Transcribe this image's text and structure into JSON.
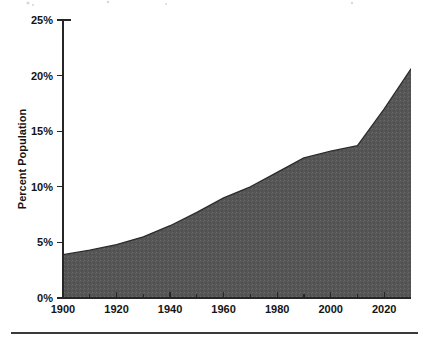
{
  "figure": {
    "background_color": "#ffffff",
    "footer_rule": {
      "name": "footer-rule",
      "color": "#3a3a3a"
    }
  },
  "chart_data": {
    "type": "area",
    "title": "",
    "subtitle": "",
    "xlabel": "",
    "ylabel": "Percent Population",
    "xlim": [
      1900,
      2030
    ],
    "ylim": [
      0,
      25
    ],
    "grid": false,
    "legend": null,
    "legend_position": "none",
    "series_color": "#565656",
    "line_color": "#2b2b2b",
    "x_tick_labels": [
      "1900",
      "1920",
      "1940",
      "1960",
      "1980",
      "2000",
      "2020"
    ],
    "x_ticks": [
      1900,
      1920,
      1940,
      1960,
      1980,
      2000,
      2020
    ],
    "x_minor_ticks": [
      1910,
      1930,
      1950,
      1970,
      1990,
      2010
    ],
    "y_tick_labels": [
      "0%",
      "5%",
      "10%",
      "15%",
      "20%",
      "25%"
    ],
    "y_ticks": [
      0,
      5,
      10,
      15,
      20,
      25
    ],
    "y_unit": "%",
    "x": [
      1900,
      1910,
      1920,
      1930,
      1940,
      1950,
      1960,
      1970,
      1980,
      1990,
      2000,
      2010,
      2020,
      2030
    ],
    "values": [
      3.9,
      4.3,
      4.8,
      5.5,
      6.5,
      7.7,
      9.0,
      10.0,
      11.3,
      12.6,
      13.2,
      13.7,
      17.0,
      20.6
    ],
    "series": [
      {
        "name": "Percent Population",
        "values": [
          3.9,
          4.3,
          4.8,
          5.5,
          6.5,
          7.7,
          9.0,
          10.0,
          11.3,
          12.6,
          13.2,
          13.7,
          17.0,
          20.6
        ]
      }
    ],
    "annotations": []
  }
}
